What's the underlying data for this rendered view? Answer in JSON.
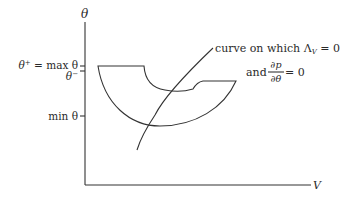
{
  "figure": {
    "y_axis": {
      "label": "θ"
    },
    "x_axis": {
      "label": "V"
    },
    "ticks": [
      {
        "id": "theta-plus",
        "label_prefix": "θ",
        "label_sup": "+",
        "label_suffix": " = max θ"
      },
      {
        "id": "theta-minus",
        "label_prefix": "θ",
        "label_sup": "−",
        "label_suffix": ""
      },
      {
        "id": "min-theta",
        "label_prefix": "min θ",
        "label_sup": "",
        "label_suffix": ""
      }
    ],
    "annotation": {
      "line1_prefix": "curve on which Λ",
      "line1_sub": "V",
      "line1_suffix": " = 0",
      "line2_prefix": "and ",
      "frac_num": "∂p",
      "frac_den": "∂θ",
      "line2_suffix": " = 0"
    }
  }
}
